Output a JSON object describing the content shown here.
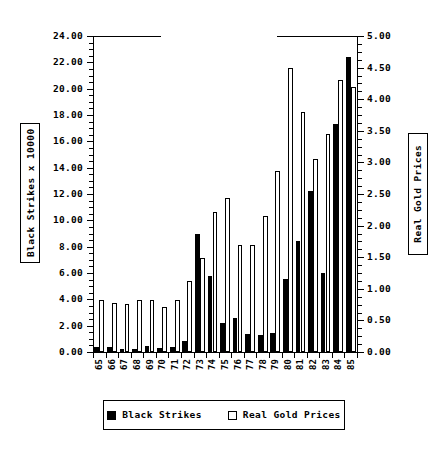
{
  "chart_data": {
    "type": "bar",
    "title": "",
    "subtitle": "",
    "xlabel": "",
    "ylabel": "Black Strikes x 10000",
    "ylabel_secondary": "Real Gold Prices",
    "grid": false,
    "legend_position": "bottom",
    "categories": [
      "65",
      "66",
      "67",
      "68",
      "69",
      "70",
      "71",
      "72",
      "73",
      "74",
      "75",
      "76",
      "77",
      "78",
      "79",
      "80",
      "81",
      "82",
      "83",
      "84",
      "85"
    ],
    "ylim": [
      0,
      24
    ],
    "ylim_secondary": [
      0,
      5
    ],
    "ytick_labels": [
      "0.00",
      "2.00",
      "4.00",
      "6.00",
      "8.00",
      "10.00",
      "12.00",
      "14.00",
      "16.00",
      "18.00",
      "20.00",
      "22.00",
      "24.00"
    ],
    "ytick_values": [
      0,
      2,
      4,
      6,
      8,
      10,
      12,
      14,
      16,
      18,
      20,
      22,
      24
    ],
    "ytick_labels_secondary": [
      "0.00",
      "0.50",
      "1.00",
      "1.50",
      "2.00",
      "2.50",
      "3.00",
      "3.50",
      "4.00",
      "4.50",
      "5.00"
    ],
    "ytick_values_secondary": [
      0,
      0.5,
      1,
      1.5,
      2,
      2.5,
      3,
      3.5,
      4,
      4.5,
      5
    ],
    "series": [
      {
        "name": "Black Strikes",
        "axis": "left",
        "color": "#000000",
        "fill": "solid",
        "values": [
          0.35,
          0.35,
          0.25,
          0.2,
          0.45,
          0.3,
          0.35,
          0.85,
          8.95,
          5.75,
          2.2,
          2.55,
          1.4,
          1.3,
          1.45,
          5.55,
          8.4,
          12.2,
          6.0,
          17.35,
          22.4
        ]
      },
      {
        "name": "Real Gold Prices",
        "axis": "right",
        "color": "#ffffff",
        "fill": "open",
        "values": [
          0.83,
          0.78,
          0.76,
          0.83,
          0.83,
          0.71,
          0.82,
          1.12,
          1.48,
          2.22,
          2.44,
          1.69,
          1.69,
          2.15,
          2.87,
          4.5,
          3.8,
          3.05,
          3.45,
          4.3,
          4.2
        ]
      }
    ]
  },
  "legend": {
    "entries": [
      {
        "label": "Black Strikes",
        "swatch": "filled-black-square"
      },
      {
        "label": "Real Gold Prices",
        "swatch": "open-white-square"
      }
    ]
  }
}
